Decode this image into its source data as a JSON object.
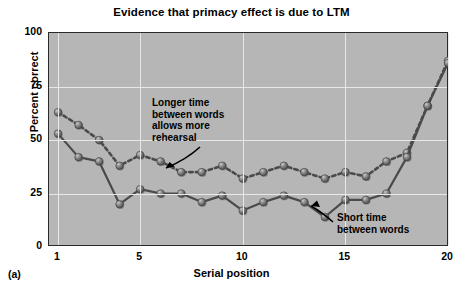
{
  "figure": {
    "title": "Evidence that primacy effect is due to LTM",
    "panel_label": "(a)"
  },
  "axes": {
    "x_title": "Serial position",
    "y_title": "Percent correct",
    "x_ticks": [
      "1",
      "5",
      "10",
      "15",
      "20"
    ],
    "y_ticks": [
      "0",
      "25",
      "50",
      "75",
      "100"
    ]
  },
  "annotations": {
    "longer": "Longer time\nbetween words\nallows more\nrehearsal",
    "short": "Short time\nbetween words"
  },
  "colors": {
    "plot_background": "#b6b6b6",
    "gridline": "#e8e8e8",
    "frame": "#2a2a2a",
    "marker": "#6e6e6e",
    "line": "#4a4a4a",
    "text": "#000000"
  },
  "chart_data": {
    "type": "line",
    "title": "Evidence that primacy effect is due to LTM",
    "xlabel": "Serial position",
    "ylabel": "Percent correct",
    "xlim": [
      1,
      20
    ],
    "ylim": [
      0,
      100
    ],
    "xticks": [
      1,
      5,
      10,
      15,
      20
    ],
    "yticks": [
      0,
      25,
      50,
      75,
      100
    ],
    "grid": true,
    "legend": "annotations-inline",
    "x": [
      1,
      2,
      3,
      4,
      5,
      6,
      7,
      8,
      9,
      10,
      11,
      12,
      13,
      14,
      15,
      16,
      17,
      18,
      19,
      20
    ],
    "series": [
      {
        "name": "Longer time between words",
        "style": "dashed",
        "values": [
          63,
          57,
          50,
          38,
          43,
          40,
          35,
          35,
          38,
          32,
          35,
          38,
          35,
          32,
          35,
          33,
          40,
          44,
          66,
          87
        ]
      },
      {
        "name": "Short time between words",
        "style": "solid",
        "values": [
          53,
          42,
          40,
          20,
          27,
          25,
          25,
          21,
          24,
          17,
          21,
          24,
          21,
          14,
          22,
          22,
          25,
          42,
          66,
          86
        ]
      }
    ]
  }
}
